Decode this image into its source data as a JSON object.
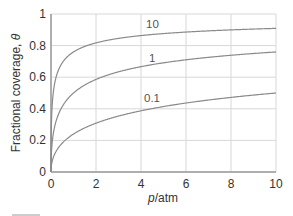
{
  "chart_data": {
    "type": "line",
    "title": "",
    "xlabel": "p/atm",
    "ylabel": "Fractional coverage, θ",
    "xlim": [
      0,
      10
    ],
    "ylim": [
      0,
      1
    ],
    "grid": true,
    "x_ticks": [
      "0",
      "2",
      "4",
      "6",
      "8",
      "10"
    ],
    "y_ticks": [
      "0",
      "0.2",
      "0.4",
      "0.6",
      "0.8",
      "1"
    ],
    "legend": "inline curve labels",
    "x": [
      0,
      0.1,
      0.25,
      0.5,
      1,
      2,
      3,
      4,
      5,
      6,
      7,
      8,
      9,
      10
    ],
    "series": [
      {
        "name": "10",
        "K": 10,
        "values": [
          0,
          0.5,
          0.61,
          0.69,
          0.76,
          0.82,
          0.85,
          0.86,
          0.88,
          0.89,
          0.89,
          0.9,
          0.9,
          0.91
        ]
      },
      {
        "name": "1",
        "K": 1,
        "values": [
          0,
          0.24,
          0.33,
          0.41,
          0.5,
          0.59,
          0.63,
          0.67,
          0.69,
          0.71,
          0.73,
          0.74,
          0.75,
          0.76
        ]
      },
      {
        "name": "0.1",
        "K": 0.1,
        "values": [
          0,
          0.09,
          0.14,
          0.18,
          0.24,
          0.31,
          0.35,
          0.39,
          0.41,
          0.44,
          0.46,
          0.47,
          0.49,
          0.5
        ]
      }
    ],
    "curve_labels": [
      "10",
      "1",
      "0.1"
    ]
  },
  "axes": {
    "xlabel_italic": "p",
    "xlabel_unit": "/atm",
    "ylabel_text": "Fractional coverage, ",
    "ylabel_symbol": "θ"
  },
  "colors": {
    "curve": "#8a8a8a",
    "grid": "#d8d8d8",
    "axis": "#9a9a9a"
  }
}
